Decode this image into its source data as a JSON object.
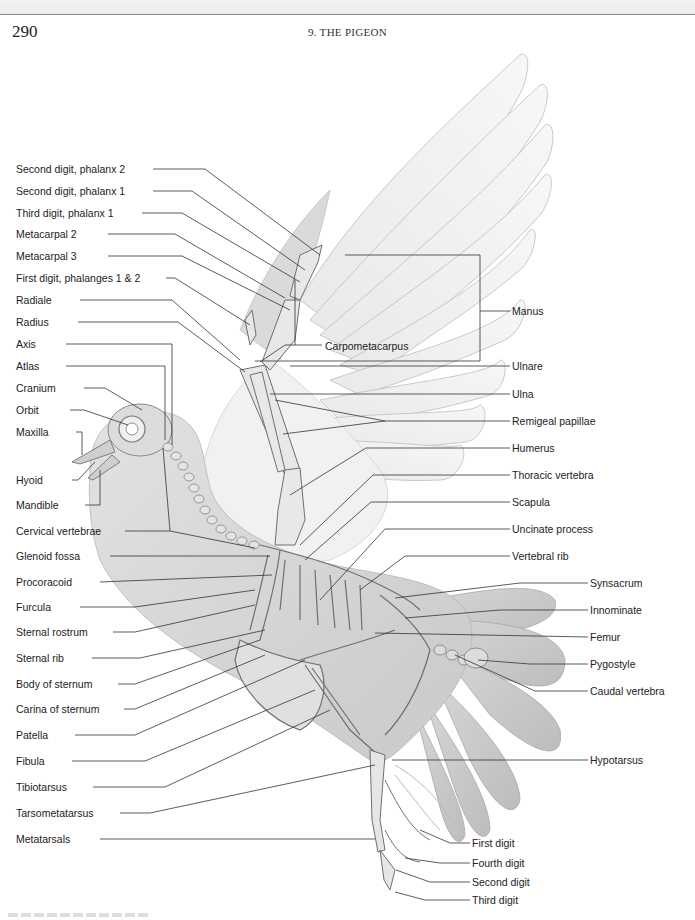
{
  "page": {
    "number": "290",
    "running_head": "9. THE PIGEON"
  },
  "figure": {
    "colors": {
      "ink": "#222222",
      "bone": "#e6e6e6",
      "feather": "#ededed",
      "body": "#d4d4d4",
      "leader": "#333333"
    },
    "labels_left": [
      {
        "id": "second-digit-phalanx-2",
        "text": "Second digit, phalanx 2",
        "x": 16,
        "y": 169
      },
      {
        "id": "second-digit-phalanx-1",
        "text": "Second digit, phalanx 1",
        "x": 16,
        "y": 191
      },
      {
        "id": "third-digit-phalanx-1",
        "text": "Third digit, phalanx 1",
        "x": 16,
        "y": 213
      },
      {
        "id": "metacarpal-2",
        "text": "Metacarpal 2",
        "x": 16,
        "y": 234
      },
      {
        "id": "metacarpal-3",
        "text": "Metacarpal 3",
        "x": 16,
        "y": 256
      },
      {
        "id": "first-digit-phalanges",
        "text": "First digit, phalanges 1 & 2",
        "x": 16,
        "y": 278
      },
      {
        "id": "radiale",
        "text": "Radiale",
        "x": 16,
        "y": 300
      },
      {
        "id": "radius",
        "text": "Radius",
        "x": 16,
        "y": 322
      },
      {
        "id": "axis",
        "text": "Axis",
        "x": 16,
        "y": 344
      },
      {
        "id": "atlas",
        "text": "Atlas",
        "x": 16,
        "y": 366
      },
      {
        "id": "cranium",
        "text": "Cranium",
        "x": 16,
        "y": 388
      },
      {
        "id": "orbit",
        "text": "Orbit",
        "x": 16,
        "y": 410
      },
      {
        "id": "maxilla",
        "text": "Maxilla",
        "x": 16,
        "y": 432
      },
      {
        "id": "hyoid",
        "text": "Hyoid",
        "x": 16,
        "y": 480
      },
      {
        "id": "mandible",
        "text": "Mandible",
        "x": 16,
        "y": 505
      },
      {
        "id": "cervical-vertebrae",
        "text": "Cervical vertebrae",
        "x": 16,
        "y": 531
      },
      {
        "id": "glenoid-fossa",
        "text": "Glenoid fossa",
        "x": 16,
        "y": 556
      },
      {
        "id": "procoracoid",
        "text": "Procoracoid",
        "x": 16,
        "y": 582
      },
      {
        "id": "furcula",
        "text": "Furcula",
        "x": 16,
        "y": 607
      },
      {
        "id": "sternal-rostrum",
        "text": "Sternal rostrum",
        "x": 16,
        "y": 632
      },
      {
        "id": "sternal-rib",
        "text": "Sternal rib",
        "x": 16,
        "y": 658
      },
      {
        "id": "body-of-sternum",
        "text": "Body of sternum",
        "x": 16,
        "y": 684
      },
      {
        "id": "carina-of-sternum",
        "text": "Carina of sternum",
        "x": 16,
        "y": 709
      },
      {
        "id": "patella",
        "text": "Patella",
        "x": 16,
        "y": 735
      },
      {
        "id": "fibula",
        "text": "Fibula",
        "x": 16,
        "y": 761
      },
      {
        "id": "tibiotarsus",
        "text": "Tibiotarsus",
        "x": 16,
        "y": 787
      },
      {
        "id": "tarsometatarsus",
        "text": "Tarsometatarsus",
        "x": 16,
        "y": 813
      },
      {
        "id": "metatarsals",
        "text": "Metatarsals",
        "x": 16,
        "y": 839
      }
    ],
    "labels_right": [
      {
        "id": "manus",
        "text": "Manus",
        "x": 512,
        "y": 311
      },
      {
        "id": "carpometacarpus",
        "text": "Carpometacarpus",
        "x": 325,
        "y": 346
      },
      {
        "id": "ulnare",
        "text": "Ulnare",
        "x": 512,
        "y": 366
      },
      {
        "id": "ulna",
        "text": "Ulna",
        "x": 512,
        "y": 394
      },
      {
        "id": "remigeal-papillae",
        "text": "Remigeal papillae",
        "x": 512,
        "y": 421
      },
      {
        "id": "humerus",
        "text": "Humerus",
        "x": 512,
        "y": 448
      },
      {
        "id": "thoracic-vertebra",
        "text": "Thoracic vertebra",
        "x": 512,
        "y": 475
      },
      {
        "id": "scapula",
        "text": "Scapula",
        "x": 512,
        "y": 502
      },
      {
        "id": "uncinate-process",
        "text": "Uncinate process",
        "x": 512,
        "y": 529
      },
      {
        "id": "vertebral-rib",
        "text": "Vertebral rib",
        "x": 512,
        "y": 556
      },
      {
        "id": "synsacrum",
        "text": "Synsacrum",
        "x": 590,
        "y": 583
      },
      {
        "id": "innominate",
        "text": "Innominate",
        "x": 590,
        "y": 610
      },
      {
        "id": "femur",
        "text": "Femur",
        "x": 590,
        "y": 637
      },
      {
        "id": "pygostyle",
        "text": "Pygostyle",
        "x": 590,
        "y": 664
      },
      {
        "id": "caudal-vertebra",
        "text": "Caudal vertebra",
        "x": 590,
        "y": 691
      },
      {
        "id": "hypotarsus",
        "text": "Hypotarsus",
        "x": 590,
        "y": 760
      },
      {
        "id": "first-digit",
        "text": "First digit",
        "x": 472,
        "y": 843
      },
      {
        "id": "fourth-digit",
        "text": "Fourth digit",
        "x": 472,
        "y": 863
      },
      {
        "id": "second-digit",
        "text": "Second digit",
        "x": 472,
        "y": 882
      },
      {
        "id": "third-digit",
        "text": "Third digit",
        "x": 472,
        "y": 900
      }
    ]
  }
}
